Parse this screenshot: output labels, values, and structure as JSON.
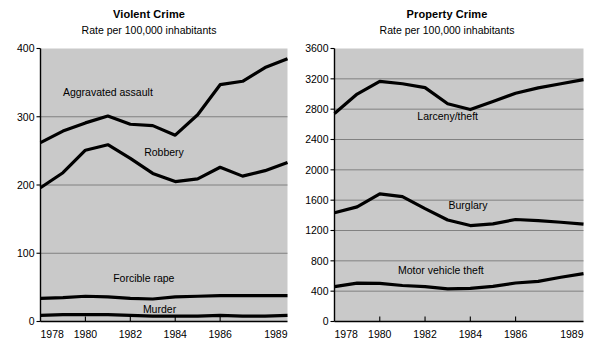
{
  "figure": {
    "background_color": "#ffffff",
    "plot_background_color": "#c9c9c9",
    "line_color": "#000000",
    "grid_color": "#6e6e6e"
  },
  "chart_data": [
    {
      "type": "line",
      "title": "Violent Crime",
      "subtitle": "Rate per 100,000 inhabitants",
      "xlabel": "",
      "ylabel": "",
      "grid": true,
      "legend_position": "inline-annotation",
      "x": [
        1978,
        1979,
        1980,
        1981,
        1982,
        1983,
        1984,
        1985,
        1986,
        1987,
        1988,
        1989
      ],
      "xtick_labels": [
        "1978",
        "1980",
        "1982",
        "1984",
        "1986",
        "1989"
      ],
      "xtick_values": [
        1978,
        1980,
        1982,
        1984,
        1986,
        1989
      ],
      "ytick_labels": [
        "0",
        "100",
        "200",
        "300",
        "400"
      ],
      "ytick_values": [
        0,
        100,
        200,
        300,
        400
      ],
      "ylim": [
        0,
        400
      ],
      "xlim": [
        1978,
        1989
      ],
      "series": [
        {
          "name": "Aggravated assault",
          "label_x": 1981.0,
          "label_y": 330,
          "values": [
            262,
            279,
            291,
            301,
            289,
            287,
            273,
            303,
            347,
            352,
            372,
            385
          ]
        },
        {
          "name": "Robbery",
          "label_x": 1983.5,
          "label_y": 243,
          "values": [
            196,
            218,
            251,
            259,
            239,
            217,
            205,
            209,
            226,
            213,
            221,
            233
          ]
        },
        {
          "name": "Forcible rape",
          "label_x": 1982.6,
          "label_y": 58,
          "values": [
            34,
            35,
            37,
            36,
            34,
            33,
            36,
            37,
            38,
            38,
            38,
            38
          ]
        },
        {
          "name": "Murder",
          "label_x": 1983.3,
          "label_y": 13,
          "values": [
            9,
            10,
            10,
            10,
            9,
            8,
            8,
            8,
            9,
            8,
            8,
            9
          ]
        }
      ]
    },
    {
      "type": "line",
      "title": "Property Crime",
      "subtitle": "Rate per 100,000 inhabitants",
      "xlabel": "",
      "ylabel": "",
      "grid": true,
      "legend_position": "inline-annotation",
      "x": [
        1978,
        1979,
        1980,
        1981,
        1982,
        1983,
        1984,
        1985,
        1986,
        1987,
        1988,
        1989
      ],
      "xtick_labels": [
        "1978",
        "1980",
        "1982",
        "1984",
        "1986",
        "1989"
      ],
      "xtick_values": [
        1978,
        1980,
        1982,
        1984,
        1986,
        1989
      ],
      "ytick_labels": [
        "0",
        "400",
        "800",
        "1200",
        "1600",
        "2000",
        "2400",
        "2800",
        "3200",
        "3600"
      ],
      "ytick_values": [
        0,
        400,
        800,
        1200,
        1600,
        2000,
        2400,
        2800,
        3200,
        3600
      ],
      "ylim": [
        0,
        3600
      ],
      "xlim": [
        1978,
        1989
      ],
      "series": [
        {
          "name": "Larceny/theft",
          "label_x": 1983.0,
          "label_y": 2660,
          "values": [
            2744,
            2999,
            3167,
            3135,
            3084,
            2871,
            2795,
            2901,
            3010,
            3081,
            3135,
            3189
          ]
        },
        {
          "name": "Burglary",
          "label_x": 1983.9,
          "label_y": 1490,
          "values": [
            1434,
            1512,
            1684,
            1647,
            1488,
            1338,
            1265,
            1287,
            1345,
            1330,
            1309,
            1283
          ]
        },
        {
          "name": "Motor vehicle theft",
          "label_x": 1982.7,
          "label_y": 630,
          "values": [
            460,
            505,
            502,
            475,
            459,
            431,
            437,
            463,
            508,
            529,
            583,
            631
          ]
        }
      ]
    }
  ]
}
